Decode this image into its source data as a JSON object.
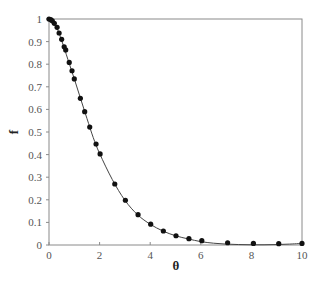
{
  "chart_data": {
    "type": "scatter",
    "title": "",
    "xlabel": "θ",
    "ylabel": "f",
    "xlim": [
      0,
      10
    ],
    "ylim": [
      0,
      1
    ],
    "grid": false,
    "legend": null,
    "x_ticks": [
      0,
      2,
      4,
      6,
      8,
      10
    ],
    "x_tick_labels": [
      "0",
      "2",
      "4",
      "6",
      "8",
      "10"
    ],
    "y_ticks": [
      0,
      0.1,
      0.2,
      0.3,
      0.4,
      0.5,
      0.6,
      0.7,
      0.8,
      0.9,
      1
    ],
    "y_tick_labels": [
      "0",
      "0.1",
      "0.2",
      "0.3",
      "0.4",
      "0.5",
      "0.6",
      "0.7",
      "0.8",
      "0.9",
      "1"
    ],
    "series": [
      {
        "name": "data points",
        "style": "markers",
        "color": "#111111",
        "x": [
          0.0,
          0.07,
          0.13,
          0.21,
          0.32,
          0.4,
          0.5,
          0.6,
          0.66,
          0.8,
          0.91,
          1.0,
          1.24,
          1.41,
          1.61,
          1.86,
          2.02,
          2.6,
          3.02,
          3.52,
          4.02,
          4.52,
          5.02,
          5.53,
          6.04,
          7.06,
          8.08,
          9.08,
          10.0
        ],
        "y": [
          1.0,
          0.997,
          0.992,
          0.981,
          0.963,
          0.938,
          0.91,
          0.877,
          0.863,
          0.808,
          0.771,
          0.735,
          0.649,
          0.59,
          0.522,
          0.447,
          0.403,
          0.27,
          0.198,
          0.134,
          0.092,
          0.062,
          0.041,
          0.028,
          0.019,
          0.01,
          0.007,
          0.006,
          0.007
        ]
      },
      {
        "name": "fitted curve",
        "style": "line",
        "color": "#444444",
        "x": [
          0,
          0.25,
          0.5,
          0.75,
          1.0,
          1.25,
          1.5,
          1.75,
          2.0,
          2.5,
          3.0,
          3.5,
          4.0,
          4.5,
          5.0,
          5.5,
          6.0,
          6.5,
          7.0,
          7.5,
          8.0,
          8.5,
          9.0,
          9.5,
          10.0
        ],
        "y": [
          1.0,
          0.975,
          0.905,
          0.82,
          0.735,
          0.647,
          0.56,
          0.475,
          0.405,
          0.29,
          0.198,
          0.134,
          0.092,
          0.062,
          0.041,
          0.027,
          0.015,
          0.008,
          0.004,
          0.002,
          0.001,
          0.001,
          0.002,
          0.004,
          0.007
        ]
      }
    ]
  }
}
